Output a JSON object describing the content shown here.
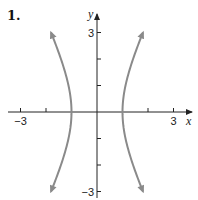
{
  "problem_label": "1.",
  "chart_data": {
    "type": "line",
    "title": "",
    "equation": "x^2 - y^2/4 = 1",
    "xlabel": "x",
    "ylabel": "y",
    "xlim": [
      -3.5,
      3.7
    ],
    "ylim": [
      -3.3,
      3.6
    ],
    "x_ticks": [
      -3,
      -2,
      -1,
      1,
      2,
      3
    ],
    "y_ticks": [
      -3,
      -2,
      -1,
      1,
      2,
      3
    ],
    "x_tick_labels": [
      {
        "value": -3,
        "text": "−3"
      },
      {
        "value": 3,
        "text": "3"
      }
    ],
    "y_tick_labels": [
      {
        "value": 3,
        "text": "3"
      },
      {
        "value": -3,
        "text": "−3"
      }
    ],
    "grid": false,
    "series": [
      {
        "name": "right-branch",
        "color": "#8a8a8a",
        "y_range": [
          -3,
          3
        ],
        "x_sign": 1,
        "arrows": "both"
      },
      {
        "name": "left-branch",
        "color": "#8a8a8a",
        "y_range": [
          -3,
          3
        ],
        "x_sign": -1,
        "arrows": "both"
      }
    ],
    "vertices": [
      [
        -1,
        0
      ],
      [
        1,
        0
      ]
    ]
  }
}
